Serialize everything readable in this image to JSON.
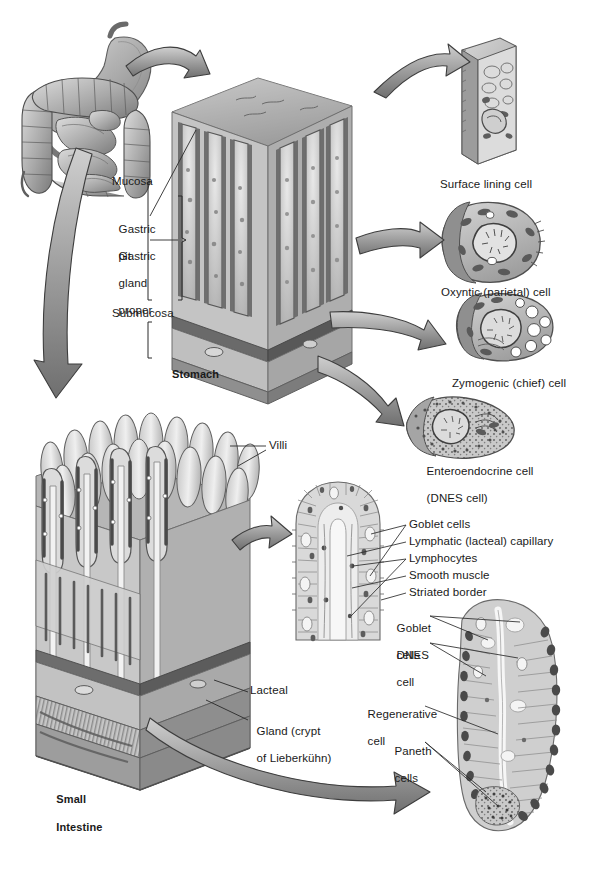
{
  "figure": {
    "palette": {
      "ink": "#1a1a1a",
      "paper": "#ffffff",
      "tissue_light": "#d8d8d8",
      "tissue_mid": "#a8a8a8",
      "tissue_dark": "#6e6e6e",
      "tissue_darkest": "#4a4a4a",
      "arrow_fill": "#9a9a9a",
      "arrow_stroke": "#3a3a3a"
    }
  },
  "regions": {
    "stomach_block_label": "Stomach",
    "intestine_block_label": "Small\nIntestine"
  },
  "labels": [
    {
      "id": "mucosa",
      "text": "Mucosa",
      "x": 112,
      "y": 181,
      "lines": [
        "Mucosa"
      ]
    },
    {
      "id": "gastric-pit",
      "text": "Gastric pit",
      "x": 112,
      "y": 215,
      "lines": [
        "Gastric",
        "pit"
      ]
    },
    {
      "id": "gastric-gland",
      "text": "Gastric gland proper",
      "x": 112,
      "y": 243,
      "lines": [
        "Gastric",
        "gland",
        "proper"
      ]
    },
    {
      "id": "submucosa",
      "text": "Submucosa",
      "x": 112,
      "y": 313,
      "lines": [
        "Submucosa"
      ]
    },
    {
      "id": "stomach",
      "text": "Stomach",
      "x": 172,
      "y": 369,
      "bold": true,
      "lines": [
        "Stomach"
      ]
    },
    {
      "id": "surface-lining-cell",
      "text": "Surface lining cell",
      "x": 440,
      "y": 178,
      "lines": [
        "Surface lining cell"
      ]
    },
    {
      "id": "oxyntic-cell",
      "text": "Oxyntic (parietal) cell",
      "x": 441,
      "y": 286,
      "lines": [
        "Oxyntic (parietal) cell"
      ]
    },
    {
      "id": "zymogenic-cell",
      "text": "Zymogenic (chief) cell",
      "x": 452,
      "y": 377,
      "lines": [
        "Zymogenic (chief) cell"
      ]
    },
    {
      "id": "enteroendocrine-cell",
      "text": "Enteroendocrine cell (DNES cell)",
      "x": 420,
      "y": 457,
      "lines": [
        "Enteroendocrine cell",
        "(DNES cell)"
      ]
    },
    {
      "id": "villi",
      "text": "Villi",
      "x": 269,
      "y": 441,
      "lines": [
        "Villi"
      ]
    },
    {
      "id": "goblet-cells-villus",
      "text": "Goblet cells",
      "x": 409,
      "y": 524,
      "lines": [
        "Goblet cells"
      ]
    },
    {
      "id": "lymphatic-capillary",
      "text": "Lymphatic (lacteal) capillary",
      "x": 409,
      "y": 541,
      "lines": [
        "Lymphatic (lacteal) capillary"
      ]
    },
    {
      "id": "lymphocytes",
      "text": "Lymphocytes",
      "x": 409,
      "y": 558,
      "lines": [
        "Lymphocytes"
      ]
    },
    {
      "id": "smooth-muscle",
      "text": "Smooth muscle",
      "x": 409,
      "y": 575,
      "lines": [
        "Smooth muscle"
      ]
    },
    {
      "id": "striated-border",
      "text": "Striated border",
      "x": 409,
      "y": 592,
      "lines": [
        "Striated border"
      ]
    },
    {
      "id": "goblet-cells-crypt",
      "text": "Goblet cells",
      "x": 390,
      "y": 614,
      "lines": [
        "Goblet",
        "cells"
      ]
    },
    {
      "id": "dnes-cell",
      "text": "DNES cell",
      "x": 390,
      "y": 641,
      "lines": [
        "DNES",
        "cell"
      ]
    },
    {
      "id": "lacteal",
      "text": "Lacteal",
      "x": 250,
      "y": 690,
      "lines": [
        "Lacteal"
      ]
    },
    {
      "id": "gland-crypt",
      "text": "Gland (crypt of Lieberkühn)",
      "x": 250,
      "y": 717,
      "lines": [
        "Gland (crypt",
        "of Lieberkühn)"
      ]
    },
    {
      "id": "regenerative-cell",
      "text": "Regenerative cell",
      "x": 361,
      "y": 700,
      "lines": [
        "Regenerative",
        "cell"
      ]
    },
    {
      "id": "paneth-cells",
      "text": "Paneth cells",
      "x": 388,
      "y": 737,
      "lines": [
        "Paneth",
        "cells"
      ]
    },
    {
      "id": "small-intestine",
      "text": "Small Intestine",
      "x": 50,
      "y": 782,
      "bold": true,
      "lines": [
        "Small",
        "Intestine"
      ]
    }
  ],
  "illustrations": [
    {
      "id": "gi-tract",
      "name": "gi-tract-overview",
      "caption": "Stomach, small and large intestine overview drawing"
    },
    {
      "id": "stomach-block",
      "name": "stomach-mucosa-block",
      "caption": "Three-dimensional block of stomach mucosa showing gastric pits and glands"
    },
    {
      "id": "surface-lining-inset",
      "name": "surface-lining-cell-inset",
      "caption": "Columnar surface lining cell"
    },
    {
      "id": "oxyntic-inset",
      "name": "oxyntic-cell-inset",
      "caption": "Oxyntic (parietal) cell with intracellular canaliculus"
    },
    {
      "id": "zymogenic-inset",
      "name": "zymogenic-cell-inset",
      "caption": "Zymogenic (chief) cell with zymogen granules"
    },
    {
      "id": "enteroendocrine-inset",
      "name": "enteroendocrine-cell-inset",
      "caption": "Enteroendocrine (DNES) cell with basal granules"
    },
    {
      "id": "intestine-block",
      "name": "small-intestine-block",
      "caption": "Three-dimensional block of small intestine wall with villi"
    },
    {
      "id": "villus-section",
      "name": "villus-section-inset",
      "caption": "Longitudinal section of a single intestinal villus"
    },
    {
      "id": "crypt-section",
      "name": "crypt-section-inset",
      "caption": "Section of crypt of Lieberkühn with Paneth and regenerative cells"
    }
  ],
  "arrows": [
    {
      "id": "tract-to-stomach",
      "name": "arrow-tract-to-stomach-block"
    },
    {
      "id": "tract-to-intestine",
      "name": "arrow-tract-to-intestine-block"
    },
    {
      "id": "block-to-surface",
      "name": "arrow-block-to-surface-lining-cell"
    },
    {
      "id": "block-to-oxyntic",
      "name": "arrow-block-to-oxyntic-cell"
    },
    {
      "id": "block-to-zymogenic",
      "name": "arrow-block-to-zymogenic-cell"
    },
    {
      "id": "block-to-enteroendocrine",
      "name": "arrow-block-to-enteroendocrine-cell"
    },
    {
      "id": "block-to-villus",
      "name": "arrow-block-to-villus-section"
    },
    {
      "id": "block-to-crypt",
      "name": "arrow-block-to-crypt-section"
    }
  ]
}
